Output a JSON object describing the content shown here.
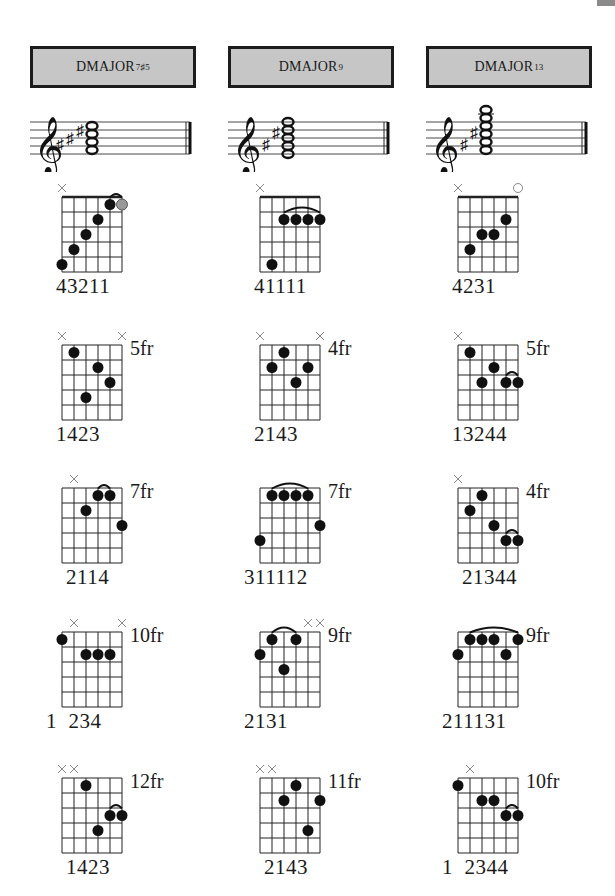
{
  "page": {
    "corner_tab_color": "#8a8a8a"
  },
  "columns": [
    {
      "chord_name": "DMAJOR",
      "chord_ext": "7♯5",
      "staff": {
        "accidentals": 3,
        "notes": 4,
        "top_note_offset": 0
      },
      "diagrams": [
        {
          "fret_label": "",
          "fingering": "43211",
          "finger_offset": 0,
          "markers": [
            "x",
            "",
            "",
            "",
            "",
            ""
          ],
          "dots": [
            [
              1,
              5
            ],
            [
              2,
              4
            ],
            [
              3,
              3
            ],
            [
              4,
              2
            ],
            [
              5,
              1
            ]
          ],
          "gray_dots": [
            [
              6,
              1
            ]
          ],
          "barres": [
            [
              5,
              6,
              "small"
            ]
          ]
        },
        {
          "fret_label": "5fr",
          "fingering": "1423",
          "finger_offset": 0,
          "markers": [
            "x",
            "",
            "",
            "",
            "",
            "x"
          ],
          "dots": [
            [
              2,
              1
            ],
            [
              3,
              4
            ],
            [
              4,
              2
            ],
            [
              5,
              3
            ]
          ],
          "gray_dots": [],
          "barres": []
        },
        {
          "fret_label": "7fr",
          "fingering": "2114",
          "finger_offset": 1,
          "markers": [
            "",
            "x",
            "",
            "",
            "",
            ""
          ],
          "dots": [
            [
              3,
              2
            ],
            [
              4,
              1
            ],
            [
              5,
              1
            ],
            [
              6,
              3
            ]
          ],
          "gray_dots": [],
          "barres": [
            [
              4,
              5,
              "small"
            ]
          ]
        },
        {
          "fret_label": "10fr",
          "fingering": "1  234",
          "finger_offset": -1,
          "markers": [
            "",
            "x",
            "",
            "",
            "",
            "x"
          ],
          "dots": [
            [
              1,
              1
            ],
            [
              3,
              2
            ],
            [
              4,
              2
            ],
            [
              5,
              2
            ]
          ],
          "gray_dots": [],
          "barres": []
        },
        {
          "fret_label": "12fr",
          "fingering": "1423",
          "finger_offset": 1,
          "markers": [
            "x",
            "x",
            "",
            "",
            "",
            ""
          ],
          "dots": [
            [
              3,
              1
            ],
            [
              4,
              4
            ],
            [
              5,
              3
            ],
            [
              6,
              3
            ]
          ],
          "gray_dots": [],
          "barres": [
            [
              5,
              6,
              "small"
            ]
          ]
        }
      ]
    },
    {
      "chord_name": "DMAJOR",
      "chord_ext": "9",
      "staff": {
        "accidentals": 2,
        "notes": 5,
        "top_note_offset": 0
      },
      "diagrams": [
        {
          "fret_label": "",
          "fingering": "41111",
          "finger_offset": 0,
          "markers": [
            "x",
            "",
            "",
            "",
            "",
            ""
          ],
          "dots": [
            [
              2,
              5
            ],
            [
              3,
              2
            ],
            [
              4,
              2
            ],
            [
              5,
              2
            ],
            [
              6,
              2
            ]
          ],
          "gray_dots": [],
          "barres": [
            [
              3,
              6,
              "large"
            ]
          ]
        },
        {
          "fret_label": "4fr",
          "fingering": "2143",
          "finger_offset": 0,
          "markers": [
            "x",
            "",
            "",
            "",
            "",
            "x"
          ],
          "dots": [
            [
              2,
              2
            ],
            [
              3,
              1
            ],
            [
              4,
              3
            ],
            [
              5,
              2
            ]
          ],
          "gray_dots": [],
          "barres": []
        },
        {
          "fret_label": "7fr",
          "fingering": "311112",
          "finger_offset": -1,
          "markers": [
            "",
            "",
            "",
            "",
            "",
            ""
          ],
          "dots": [
            [
              1,
              4
            ],
            [
              2,
              1
            ],
            [
              3,
              1
            ],
            [
              4,
              1
            ],
            [
              5,
              1
            ],
            [
              6,
              3
            ]
          ],
          "gray_dots": [],
          "barres": [
            [
              2,
              5,
              "large"
            ]
          ]
        },
        {
          "fret_label": "9fr",
          "fingering": "2131",
          "finger_offset": -1,
          "markers": [
            "",
            "",
            "",
            "",
            "x",
            "x"
          ],
          "dots": [
            [
              1,
              2
            ],
            [
              2,
              1
            ],
            [
              3,
              3
            ],
            [
              4,
              1
            ]
          ],
          "gray_dots": [],
          "barres": [
            [
              2,
              4,
              "large"
            ]
          ]
        },
        {
          "fret_label": "11fr",
          "fingering": "2143",
          "finger_offset": 1,
          "markers": [
            "x",
            "x",
            "",
            "",
            "",
            ""
          ],
          "dots": [
            [
              3,
              2
            ],
            [
              4,
              1
            ],
            [
              5,
              4
            ],
            [
              6,
              2
            ]
          ],
          "gray_dots": [],
          "barres": []
        }
      ]
    },
    {
      "chord_name": "DMAJOR",
      "chord_ext": "13",
      "staff": {
        "accidentals": 2,
        "notes": 6,
        "top_note_offset": 1
      },
      "diagrams": [
        {
          "fret_label": "",
          "fingering": "4231",
          "finger_offset": 0,
          "markers": [
            "x",
            "",
            "",
            "",
            "",
            "o"
          ],
          "dots": [
            [
              2,
              4
            ],
            [
              3,
              3
            ],
            [
              4,
              3
            ],
            [
              5,
              2
            ]
          ],
          "gray_dots": [],
          "barres": []
        },
        {
          "fret_label": "5fr",
          "fingering": "13244",
          "finger_offset": 0,
          "markers": [
            "x",
            "",
            "",
            "",
            "",
            ""
          ],
          "dots": [
            [
              2,
              1
            ],
            [
              3,
              3
            ],
            [
              4,
              2
            ],
            [
              5,
              3
            ],
            [
              6,
              3
            ]
          ],
          "gray_dots": [],
          "barres": [
            [
              5,
              6,
              "small"
            ]
          ]
        },
        {
          "fret_label": "4fr",
          "fingering": "21344",
          "finger_offset": 1,
          "markers": [
            "x",
            "",
            "",
            "",
            "",
            ""
          ],
          "dots": [
            [
              2,
              2
            ],
            [
              3,
              1
            ],
            [
              4,
              3
            ],
            [
              5,
              4
            ],
            [
              6,
              4
            ]
          ],
          "gray_dots": [],
          "barres": [
            [
              5,
              6,
              "small"
            ]
          ]
        },
        {
          "fret_label": "9fr",
          "fingering": "211131",
          "finger_offset": -1,
          "markers": [
            "",
            "",
            "",
            "",
            "",
            ""
          ],
          "dots": [
            [
              1,
              2
            ],
            [
              2,
              1
            ],
            [
              3,
              1
            ],
            [
              4,
              1
            ],
            [
              5,
              2
            ],
            [
              6,
              1
            ]
          ],
          "gray_dots": [],
          "barres": [
            [
              2,
              6,
              "large"
            ]
          ]
        },
        {
          "fret_label": "10fr",
          "fingering": "1  2344",
          "finger_offset": -1,
          "markers": [
            "",
            "x",
            "",
            "",
            "",
            ""
          ],
          "dots": [
            [
              1,
              1
            ],
            [
              3,
              2
            ],
            [
              4,
              2
            ],
            [
              5,
              3
            ],
            [
              6,
              3
            ]
          ],
          "gray_dots": [],
          "barres": [
            [
              5,
              6,
              "small"
            ]
          ]
        }
      ]
    }
  ]
}
